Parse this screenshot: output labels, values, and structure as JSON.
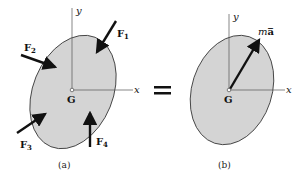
{
  "diagram": {
    "panel_a": {
      "caption": "(a)",
      "axes": {
        "x": "x",
        "y": "y"
      },
      "origin_label": "G",
      "forces": [
        {
          "name": "F",
          "sub": "1"
        },
        {
          "name": "F",
          "sub": "2"
        },
        {
          "name": "F",
          "sub": "3"
        },
        {
          "name": "F",
          "sub": "4"
        }
      ]
    },
    "equals_sign": "=",
    "panel_b": {
      "caption": "(b)",
      "axes": {
        "x": "x",
        "y": "y"
      },
      "origin_label": "G",
      "resultant": {
        "m": "m",
        "a": "a̅"
      }
    },
    "colors": {
      "body_fill": "#d4d4d4",
      "outline": "#333333",
      "arrow": "#111111"
    }
  }
}
